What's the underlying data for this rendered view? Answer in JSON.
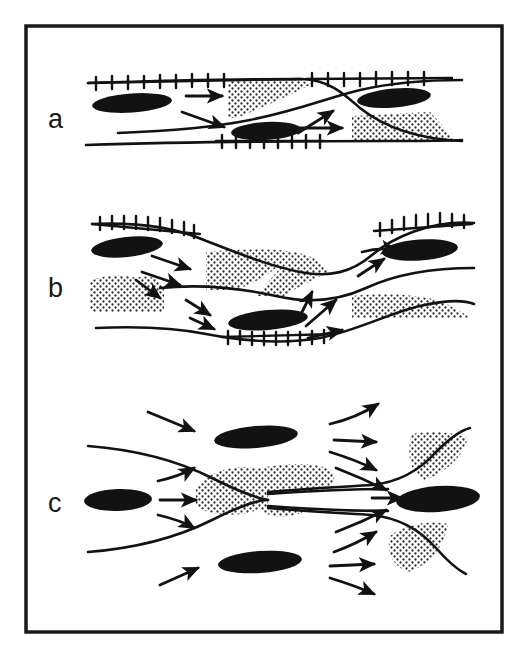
{
  "figure": {
    "background_color": "#ffffff",
    "ink_color": "#121212",
    "stipple_color": "#2b2b2b",
    "border": {
      "x": 26,
      "y": 26,
      "width": 476,
      "height": 606,
      "stroke_width": 3.5,
      "color": "#1a1a1a"
    }
  },
  "legend_semantics": {
    "black_lens": "porphyroclast / rigid lens (solid black lenticular body)",
    "stipple_patch": "pressure-shadow / low-strain stippled domain",
    "ticked_line": "shear-zone boundary with tick (hachure) marks",
    "plain_curve": "flow-path / zone boundary line",
    "arrow": "local flow / displacement direction vector"
  },
  "panels": [
    {
      "id": "a",
      "label": "a",
      "label_x": 48,
      "label_y": 128,
      "description": "Anastomosing shear zone, sub-horizontal, two ticked boundaries converging to the right",
      "counts": {
        "black_lenses": 3,
        "stipple_patches": 2,
        "ticked_lines": 3,
        "arrows": 4
      }
    },
    {
      "id": "b",
      "label": "b",
      "label_x": 48,
      "label_y": 297,
      "description": "Sigmoidal pinch-and-swell shear zone with diverging then converging flow",
      "counts": {
        "black_lenses": 3,
        "stipple_patches": 4,
        "ticked_lines": 3,
        "arrows": 10
      }
    },
    {
      "id": "c",
      "label": "c",
      "label_x": 48,
      "label_y": 512,
      "description": "Constriction / throat geometry: flow converges into a narrow neck then re-diverges",
      "counts": {
        "black_lenses": 4,
        "stipple_patches": 4,
        "ticked_lines": 0,
        "arrows": 13
      }
    }
  ],
  "panel_a": {
    "black_lenses": [
      {
        "cx": 132,
        "cy": 103,
        "rx": 40,
        "ry": 9.5,
        "rot": -4
      },
      {
        "cx": 266,
        "cy": 131,
        "rx": 35,
        "ry": 9,
        "rot": -3
      },
      {
        "cx": 394,
        "cy": 98,
        "rx": 37,
        "ry": 9.5,
        "rot": -5
      }
    ],
    "stipple_patches": [
      {
        "d": "M 228 80 L 300 80 L 312 84 Q 272 104 236 118 L 228 118 Z"
      },
      {
        "d": "M 352 116 L 430 112 Q 445 128 455 141 L 352 141 Z"
      }
    ],
    "ticked_lines": [
      {
        "pts": "88,83 160,80 236,79 300,79",
        "ticks": 9,
        "side": "both"
      },
      {
        "pts": "304,79 360,79 420,78 462,79",
        "ticks": 8,
        "side": "both"
      },
      {
        "pts": "216,141 270,141 322,141",
        "ticks": 8,
        "side": "both"
      }
    ],
    "curves": [
      {
        "d": "M 88 83 C 180 80 260 79 302 79 C 330 80 345 95 360 108 C 385 128 420 139 462 141"
      },
      {
        "d": "M 118 133 C 170 131 210 128 250 120 C 300 110 330 97 360 90 C 395 82 430 80 462 80"
      },
      {
        "d": "M 86 145 C 180 142 300 141 390 141 C 430 141 450 141 462 140"
      }
    ],
    "arrows": [
      {
        "x1": 186,
        "y1": 96,
        "x2": 224,
        "y2": 96,
        "curved": false
      },
      {
        "x1": 182,
        "y1": 112,
        "x2": 226,
        "y2": 128,
        "curved": false
      },
      {
        "x1": 298,
        "y1": 133,
        "x2": 334,
        "y2": 110,
        "curved": false
      },
      {
        "x1": 300,
        "y1": 128,
        "x2": 344,
        "y2": 128,
        "curved": false
      }
    ]
  },
  "panel_b": {
    "black_lenses": [
      {
        "cx": 127,
        "cy": 247,
        "rx": 36,
        "ry": 10,
        "rot": -6
      },
      {
        "cx": 268,
        "cy": 320,
        "rx": 40,
        "ry": 10,
        "rot": -5
      },
      {
        "cx": 420,
        "cy": 250,
        "rx": 38,
        "ry": 10.5,
        "rot": -4
      }
    ],
    "stipple_patches": [
      {
        "d": "M 206 252 C 240 249 272 248 292 252 C 280 268 258 282 236 290 L 206 290 Z"
      },
      {
        "d": "M 294 252 C 312 255 322 262 330 272 C 312 280 296 288 284 296 L 256 296 Z"
      },
      {
        "d": "M 90 281 C 104 275 122 274 136 278 C 148 274 160 278 164 288 L 164 312 L 90 312 Z"
      },
      {
        "d": "M 352 296 C 382 293 412 294 436 300 C 452 306 462 312 470 318 L 352 318 Z"
      }
    ],
    "ticked_lines": [
      {
        "pts": "92,224 132,222 172,226 200,234",
        "ticks": 10,
        "side": "both"
      },
      {
        "pts": "372,231 408,222 444,219 474,224",
        "ticks": 11,
        "side": "both"
      },
      {
        "pts": "222,337 268,339 310,339 336,334",
        "ticks": 11,
        "side": "both"
      }
    ],
    "curves": [
      {
        "d": "M 92 224 C 140 222 176 228 204 240 C 240 254 270 266 300 272 C 330 278 352 272 372 255 C 392 238 430 220 474 223"
      },
      {
        "d": "M 160 288 C 200 284 240 288 276 296 C 310 304 340 300 366 288 C 396 274 430 268 474 268"
      },
      {
        "d": "M 96 328 C 140 326 176 328 206 334 C 248 342 286 344 320 338 C 356 331 392 312 420 306 C 446 300 464 300 474 304"
      }
    ],
    "arrows": [
      {
        "x1": 152,
        "y1": 256,
        "x2": 192,
        "y2": 270,
        "curved": false
      },
      {
        "x1": 142,
        "y1": 272,
        "x2": 182,
        "y2": 286,
        "curved": false
      },
      {
        "x1": 136,
        "y1": 280,
        "x2": 162,
        "y2": 300,
        "curved": false
      },
      {
        "x1": 186,
        "y1": 300,
        "x2": 212,
        "y2": 316,
        "curved": false
      },
      {
        "x1": 190,
        "y1": 318,
        "x2": 216,
        "y2": 330,
        "curved": false
      },
      {
        "x1": 298,
        "y1": 320,
        "x2": 312,
        "y2": 290,
        "curved": false
      },
      {
        "x1": 306,
        "y1": 326,
        "x2": 338,
        "y2": 298,
        "curved": false
      },
      {
        "x1": 308,
        "y1": 338,
        "x2": 344,
        "y2": 330,
        "curved": false
      },
      {
        "x1": 358,
        "y1": 276,
        "x2": 386,
        "y2": 258,
        "curved": false
      },
      {
        "x1": 362,
        "y1": 252,
        "x2": 398,
        "y2": 250,
        "curved": true
      }
    ]
  },
  "panel_c": {
    "black_lenses": [
      {
        "cx": 256,
        "cy": 437,
        "rx": 42,
        "ry": 11,
        "rot": -5
      },
      {
        "cx": 118,
        "cy": 500,
        "rx": 34,
        "ry": 11,
        "rot": -2
      },
      {
        "cx": 260,
        "cy": 562,
        "rx": 42,
        "ry": 11,
        "rot": -4
      },
      {
        "cx": 438,
        "cy": 499,
        "rx": 42,
        "ry": 13,
        "rot": -4
      }
    ],
    "stipple_patches": [
      {
        "d": "M 196 487 C 210 470 240 462 262 470 C 274 478 276 492 268 504 C 250 518 212 518 196 506 Z"
      },
      {
        "d": "M 252 470 C 292 460 330 463 334 474 C 336 492 320 510 290 516 C 262 520 250 504 252 488 Z"
      },
      {
        "d": "M 412 434 C 432 430 452 432 468 438 C 462 458 444 474 424 480 C 410 474 406 452 412 434 Z"
      },
      {
        "d": "M 390 536 C 406 524 430 520 448 524 C 444 548 428 566 408 572 C 392 566 386 550 390 536 Z"
      }
    ],
    "ticked_lines": [],
    "curves": [
      {
        "d": "M 88 446 C 140 450 180 462 212 478 C 240 492 256 498 268 500"
      },
      {
        "d": "M 88 552 C 140 548 180 536 212 520 C 240 506 256 500 268 500"
      },
      {
        "d": "M 268 492 C 300 489 340 487 372 485 C 400 482 420 470 436 452 C 452 436 462 430 470 428"
      },
      {
        "d": "M 268 508 C 300 511 340 513 372 515 C 400 518 420 530 436 548 C 450 564 458 570 466 574"
      },
      {
        "d": "M 268 496 C 310 492 350 490 386 489"
      },
      {
        "d": "M 268 504 C 310 508 350 510 386 511"
      }
    ],
    "arrows": [
      {
        "x1": 148,
        "y1": 412,
        "x2": 196,
        "y2": 432,
        "curved": false
      },
      {
        "x1": 158,
        "y1": 481,
        "x2": 196,
        "y2": 478,
        "curved": true
      },
      {
        "x1": 160,
        "y1": 500,
        "x2": 198,
        "y2": 500,
        "curved": false
      },
      {
        "x1": 158,
        "y1": 515,
        "x2": 196,
        "y2": 522,
        "curved": true
      },
      {
        "x1": 160,
        "y1": 585,
        "x2": 200,
        "y2": 568,
        "curved": false
      },
      {
        "x1": 330,
        "y1": 424,
        "x2": 380,
        "y2": 406,
        "curved": true
      },
      {
        "x1": 334,
        "y1": 440,
        "x2": 378,
        "y2": 442,
        "curved": false
      },
      {
        "x1": 330,
        "y1": 452,
        "x2": 378,
        "y2": 468,
        "curved": true
      },
      {
        "x1": 372,
        "y1": 498,
        "x2": 404,
        "y2": 498,
        "curved": false
      },
      {
        "x1": 334,
        "y1": 552,
        "x2": 378,
        "y2": 534,
        "curved": true
      },
      {
        "x1": 330,
        "y1": 566,
        "x2": 376,
        "y2": 564,
        "curved": false
      },
      {
        "x1": 330,
        "y1": 578,
        "x2": 376,
        "y2": 596,
        "curved": true
      },
      {
        "x1": 370,
        "y1": 520,
        "x2": 404,
        "y2": 506,
        "curved": false
      }
    ]
  }
}
